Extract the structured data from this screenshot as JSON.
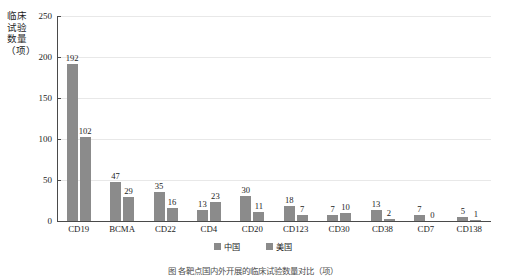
{
  "chart_data": {
    "type": "bar",
    "title": "",
    "xlabel": "",
    "ylabel": "临床试验数量（项）",
    "ylim": [
      0,
      250
    ],
    "yticks": [
      0,
      50,
      100,
      150,
      200,
      250
    ],
    "grid": true,
    "legend_position": "bottom",
    "categories": [
      "CD19",
      "BCMA",
      "CD22",
      "CD4",
      "CD20",
      "CD123",
      "CD30",
      "CD38",
      "CD7",
      "CD138"
    ],
    "series": [
      {
        "name": "中国",
        "color": "#8b8b8b",
        "values": [
          192,
          47,
          35,
          13,
          30,
          18,
          7,
          13,
          7,
          5
        ]
      },
      {
        "name": "美国",
        "color": "#8b8b8b",
        "values": [
          102,
          29,
          16,
          23,
          11,
          7,
          10,
          2,
          0,
          1
        ]
      }
    ]
  },
  "caption": {
    "text": "图  各靶点国内外开展的临床试验数量对比（项）"
  }
}
